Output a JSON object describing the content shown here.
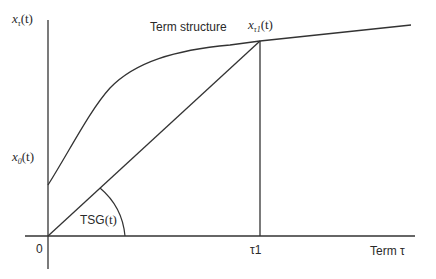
{
  "diagram": {
    "axes": {
      "y_label": {
        "base": "x",
        "sub": "τ",
        "arg": "(t)"
      },
      "x_label": "Term τ",
      "origin_label": "0"
    },
    "curve_label": "Term structure",
    "intercept_label": {
      "base": "x",
      "sub": "0",
      "arg": "(t)"
    },
    "point_label": {
      "base": "x",
      "sub": "τ1",
      "arg": "(t)"
    },
    "tick_label": "τ1",
    "angle_label": {
      "text": "TSG",
      "arg": "(t)"
    },
    "colors": {
      "line": "#333333",
      "background": "#ffffff"
    }
  }
}
